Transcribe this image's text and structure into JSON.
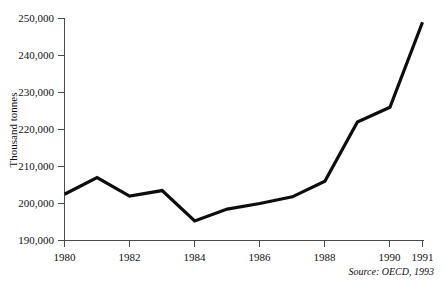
{
  "chart_data": {
    "type": "line",
    "title": "",
    "xlabel": "",
    "ylabel": "Thousand tonnes",
    "x": [
      1980,
      1981,
      1982,
      1983,
      1984,
      1985,
      1986,
      1987,
      1988,
      1989,
      1990,
      1991
    ],
    "values": [
      202500,
      207000,
      202000,
      203500,
      195300,
      198500,
      200000,
      201800,
      206000,
      222000,
      226000,
      249000
    ],
    "series": [
      {
        "name": "Thousand tonnes",
        "values": [
          202500,
          207000,
          202000,
          203500,
          195300,
          198500,
          200000,
          201800,
          206000,
          222000,
          226000,
          249000
        ]
      }
    ],
    "ylim": [
      190000,
      250000
    ],
    "xlim": [
      1980,
      1991
    ],
    "ytick_values": [
      190000,
      200000,
      210000,
      220000,
      230000,
      240000,
      250000
    ],
    "ytick_labels": [
      "190,000",
      "200,000",
      "210,000",
      "220,000",
      "230,000",
      "240,000",
      "250,000"
    ],
    "xtick_values": [
      1980,
      1982,
      1984,
      1986,
      1988,
      1990,
      1991
    ],
    "xtick_labels": [
      "1980",
      "1982",
      "1984",
      "1986",
      "1988",
      "1990",
      "1991"
    ],
    "grid": false,
    "legend": false,
    "legend_position": "none",
    "annotations": [
      "Source: OECD, 1993"
    ],
    "line_color": "#0d0d0d",
    "axis_color": "#4a4a4a",
    "background_color": "#ffffff"
  },
  "figure": {
    "source_note": "Source: OECD, 1993",
    "y_axis_title": "Thousand tonnes"
  }
}
